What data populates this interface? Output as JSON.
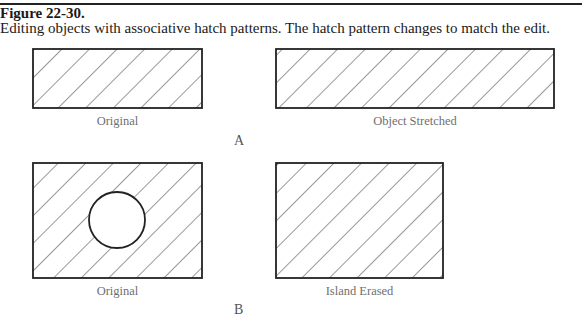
{
  "figure": {
    "number": "Figure 22-30.",
    "caption": "Editing objects with associative hatch patterns. The hatch pattern changes to match the edit."
  },
  "panels": {
    "a": {
      "part_label": "A",
      "left": {
        "label": "Original"
      },
      "right": {
        "label": "Object Stretched"
      }
    },
    "b": {
      "part_label": "B",
      "left": {
        "label": "Original"
      },
      "right": {
        "label": "Island Erased"
      }
    }
  }
}
